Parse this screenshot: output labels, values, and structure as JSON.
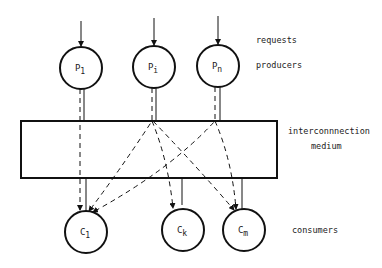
{
  "diagram": {
    "labels": {
      "requests": "requests",
      "producers": "producers",
      "medium_line1": "interconnnection",
      "medium_line2": "medium",
      "consumers": "consumers"
    },
    "producers": [
      {
        "id": "P1",
        "base": "P",
        "sub": "1"
      },
      {
        "id": "Pi",
        "base": "P",
        "sub": "i"
      },
      {
        "id": "Pn",
        "base": "P",
        "sub": "n"
      }
    ],
    "consumers": [
      {
        "id": "C1",
        "base": "C",
        "sub": "1"
      },
      {
        "id": "Ck",
        "base": "C",
        "sub": "k"
      },
      {
        "id": "Cm",
        "base": "C",
        "sub": "m"
      }
    ],
    "colors": {
      "stroke": "#111111",
      "background": "#ffffff"
    }
  }
}
